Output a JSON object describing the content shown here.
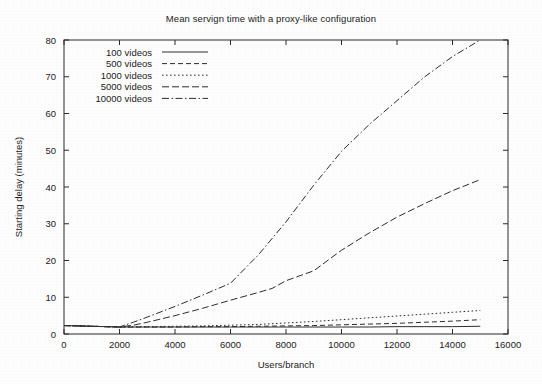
{
  "chart_data": {
    "type": "line",
    "title": "Mean servign time with a proxy-like configuration",
    "xlabel": "Users/branch",
    "ylabel": "Starting delay (minutes)",
    "xlim": [
      0,
      16000
    ],
    "ylim": [
      0,
      80
    ],
    "xticks": [
      0,
      2000,
      4000,
      6000,
      8000,
      10000,
      12000,
      14000,
      16000
    ],
    "yticks": [
      0,
      10,
      20,
      30,
      40,
      50,
      60,
      70,
      80
    ],
    "xtick_labels": [
      "0",
      "2000",
      "4000",
      "6000",
      "8000",
      "10000",
      "12000",
      "14000",
      "16000"
    ],
    "ytick_labels": [
      "0",
      "10",
      "20",
      "30",
      "40",
      "50",
      "60",
      "70",
      "80"
    ],
    "grid": false,
    "legend_position": "top-left",
    "line_color": "#2e2e2e",
    "series": [
      {
        "name": "100 videos",
        "dash": "solid",
        "dasharray": "none",
        "x": [
          0,
          500,
          1000,
          1500,
          2000,
          3000,
          4000,
          5000,
          6000,
          7000,
          8000,
          9000,
          10000,
          11000,
          12000,
          13000,
          14000,
          15000
        ],
        "values": [
          2.3,
          2.2,
          2.1,
          2.0,
          1.9,
          1.9,
          1.9,
          1.9,
          1.9,
          1.9,
          1.9,
          1.9,
          1.9,
          1.9,
          2.0,
          2.0,
          2.0,
          2.1
        ]
      },
      {
        "name": "500 videos",
        "dash": "dashed",
        "dasharray": "5,3",
        "x": [
          0,
          500,
          1000,
          1500,
          2000,
          3000,
          4000,
          5000,
          6000,
          7000,
          8000,
          9000,
          10000,
          11000,
          12000,
          13000,
          14000,
          15000
        ],
        "values": [
          2.3,
          2.2,
          2.1,
          2.0,
          1.9,
          1.9,
          1.9,
          2.0,
          2.0,
          2.1,
          2.2,
          2.3,
          2.5,
          2.7,
          2.9,
          3.2,
          3.5,
          3.9
        ]
      },
      {
        "name": "1000 videos",
        "dash": "dotted",
        "dasharray": "1.6,2.4",
        "x": [
          0,
          500,
          1000,
          1500,
          2000,
          3000,
          4000,
          5000,
          6000,
          7000,
          8000,
          9000,
          10000,
          11000,
          12000,
          13000,
          14000,
          15000
        ],
        "values": [
          2.3,
          2.2,
          2.1,
          2.0,
          1.9,
          2.0,
          2.1,
          2.2,
          2.4,
          2.6,
          3.0,
          3.4,
          3.9,
          4.4,
          4.9,
          5.4,
          5.9,
          6.4
        ]
      },
      {
        "name": "5000 videos",
        "dash": "dashed-long",
        "dasharray": "7,3",
        "x": [
          0,
          500,
          1000,
          1500,
          2000,
          2500,
          3000,
          4000,
          5000,
          6000,
          7000,
          7500,
          8000,
          9000,
          10000,
          11000,
          12000,
          13000,
          14000,
          15000
        ],
        "values": [
          2.3,
          2.2,
          2.1,
          2.0,
          1.9,
          2.4,
          3.2,
          5.0,
          7.0,
          9.2,
          11.3,
          12.4,
          14.5,
          17.2,
          22.8,
          27.5,
          31.8,
          35.5,
          39.0,
          42.0
        ]
      },
      {
        "name": "10000 videos",
        "dash": "dash-dot",
        "dasharray": "7,2.5,1.5,2.5",
        "x": [
          0,
          500,
          1000,
          1500,
          2000,
          2500,
          3000,
          4000,
          5000,
          6000,
          7000,
          8000,
          9000,
          10000,
          11000,
          12000,
          13000,
          14000,
          15000
        ],
        "values": [
          2.3,
          2.2,
          2.1,
          2.0,
          1.9,
          3.2,
          4.6,
          7.5,
          10.6,
          13.8,
          21.5,
          30.5,
          40.5,
          49.7,
          57.0,
          63.5,
          70.0,
          75.5,
          80.0
        ]
      }
    ]
  },
  "legend": {
    "entries": [
      {
        "label": "100 videos"
      },
      {
        "label": "500 videos"
      },
      {
        "label": "1000 videos"
      },
      {
        "label": "5000 videos"
      },
      {
        "label": "10000 videos"
      }
    ]
  }
}
